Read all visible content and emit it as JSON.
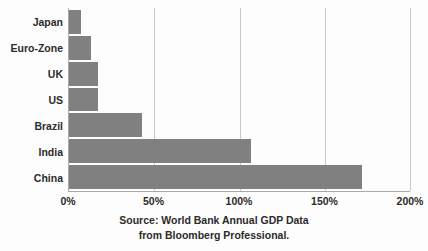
{
  "chart_data": {
    "type": "bar",
    "orientation": "horizontal",
    "title": "",
    "xlabel": "",
    "ylabel": "",
    "categories": [
      "Japan",
      "Euro-Zone",
      "UK",
      "US",
      "Brazil",
      "India",
      "China"
    ],
    "values": [
      7,
      13,
      17,
      17,
      43,
      107,
      172
    ],
    "xlim": [
      0,
      200
    ],
    "xticks": [
      0,
      50,
      100,
      150,
      200
    ],
    "xtick_labels": [
      "0%",
      "50%",
      "100%",
      "150%",
      "200%"
    ],
    "grid": true,
    "grid_axis": "x",
    "legend": false,
    "bar_color": "#808080",
    "axis_color": "#a9a9a9",
    "gridline_color": "#c8c8c8",
    "text_color": "#2b2b2b",
    "background_color": "#fdfdfd",
    "annotations": {
      "source_line_1": "Source:  World Bank Annual GDP Data",
      "source_line_2": "from Bloomberg Professional."
    }
  }
}
